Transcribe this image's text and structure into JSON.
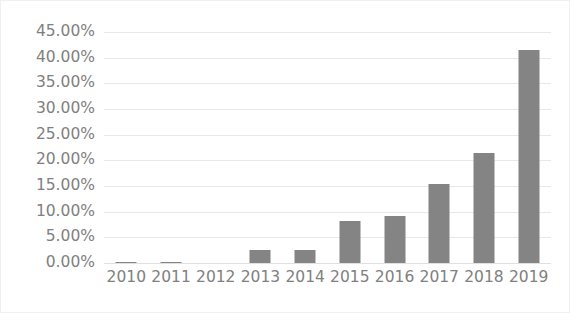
{
  "chart_data": {
    "type": "bar",
    "title": "",
    "subtitle": "",
    "xlabel": "",
    "ylabel": "",
    "categories": [
      "2010",
      "2011",
      "2012",
      "2013",
      "2014",
      "2015",
      "2016",
      "2017",
      "2018",
      "2019"
    ],
    "values": [
      0.2,
      0.2,
      0.0,
      2.5,
      2.5,
      8.1,
      9.1,
      15.4,
      21.5,
      41.4
    ],
    "value_labels": [
      "0.20%",
      "0.20%",
      "0.00%",
      "2.50%",
      "2.50%",
      "8.10%",
      "9.10%",
      "15.40%",
      "21.50%",
      "41.40%"
    ],
    "ylim": [
      0,
      45
    ],
    "ytick_values": [
      0,
      5,
      10,
      15,
      20,
      25,
      30,
      35,
      40,
      45
    ],
    "ytick_labels": [
      "0.00%",
      "5.00%",
      "10.00%",
      "15.00%",
      "20.00%",
      "25.00%",
      "30.00%",
      "35.00%",
      "40.00%",
      "45.00%"
    ],
    "grid": true,
    "grid_axis": "y",
    "legend": false,
    "legend_position": "none",
    "series": [
      {
        "name": "",
        "color": "#848484",
        "values": [
          0.2,
          0.2,
          0.0,
          2.5,
          2.5,
          8.1,
          9.1,
          15.4,
          21.5,
          41.4
        ]
      }
    ],
    "colors": {
      "bar": "#848484",
      "gridline": "#e8e8e8",
      "baseline": "#e0e0e0",
      "tick_label": "#808080",
      "background": "#ffffff",
      "border": "#f0f0f0"
    }
  }
}
